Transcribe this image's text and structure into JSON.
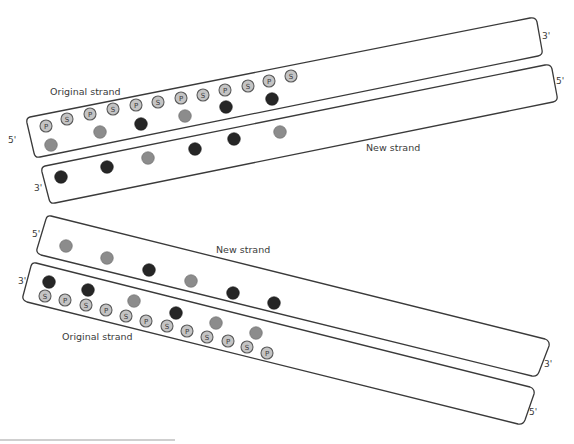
{
  "diagram": {
    "type": "DNA semiconservative replication",
    "colors": {
      "stroke": "#3a3a3a",
      "sp_fill": "#c4c4c4",
      "base_gray": "#8c8c8c",
      "base_dark": "#262626"
    },
    "top_pair": {
      "original": {
        "label": "Original strand",
        "left_end": "5'",
        "right_end": "3'",
        "backbone": [
          {
            "t": "P",
            "x": 46,
            "y": 126
          },
          {
            "t": "S",
            "x": 67,
            "y": 119
          },
          {
            "t": "P",
            "x": 90,
            "y": 114
          },
          {
            "t": "S",
            "x": 113,
            "y": 109
          },
          {
            "t": "P",
            "x": 136,
            "y": 105
          },
          {
            "t": "S",
            "x": 158,
            "y": 102
          },
          {
            "t": "P",
            "x": 181,
            "y": 98
          },
          {
            "t": "S",
            "x": 203,
            "y": 95
          },
          {
            "t": "P",
            "x": 225,
            "y": 90
          },
          {
            "t": "S",
            "x": 248,
            "y": 86
          },
          {
            "t": "P",
            "x": 269,
            "y": 81
          },
          {
            "t": "S",
            "x": 291,
            "y": 76
          }
        ],
        "bases": [
          {
            "c": "gray",
            "x": 51,
            "y": 145
          },
          {
            "c": "gray",
            "x": 100,
            "y": 132
          },
          {
            "c": "dark",
            "x": 141,
            "y": 124
          },
          {
            "c": "gray",
            "x": 185,
            "y": 116
          },
          {
            "c": "dark",
            "x": 226,
            "y": 107
          },
          {
            "c": "dark",
            "x": 272,
            "y": 99
          }
        ]
      },
      "new": {
        "label": "New strand",
        "left_end": "3'",
        "right_end": "5'",
        "bases": [
          {
            "c": "dark",
            "x": 61,
            "y": 177
          },
          {
            "c": "dark",
            "x": 107,
            "y": 167
          },
          {
            "c": "gray",
            "x": 148,
            "y": 158
          },
          {
            "c": "dark",
            "x": 195,
            "y": 149
          },
          {
            "c": "dark",
            "x": 234,
            "y": 139
          },
          {
            "c": "gray",
            "x": 280,
            "y": 132
          }
        ]
      }
    },
    "bottom_pair": {
      "new": {
        "label": "New strand",
        "left_end": "5'",
        "right_end": "3'",
        "bases": [
          {
            "c": "gray",
            "x": 66,
            "y": 246
          },
          {
            "c": "gray",
            "x": 107,
            "y": 258
          },
          {
            "c": "dark",
            "x": 149,
            "y": 270
          },
          {
            "c": "gray",
            "x": 191,
            "y": 281
          },
          {
            "c": "dark",
            "x": 233,
            "y": 293
          },
          {
            "c": "dark",
            "x": 274,
            "y": 303
          }
        ]
      },
      "original": {
        "label": "Original strand",
        "left_end": "3'",
        "right_end": "5'",
        "bases": [
          {
            "c": "dark",
            "x": 49,
            "y": 282
          },
          {
            "c": "dark",
            "x": 88,
            "y": 290
          },
          {
            "c": "gray",
            "x": 134,
            "y": 301
          },
          {
            "c": "dark",
            "x": 176,
            "y": 313
          },
          {
            "c": "gray",
            "x": 216,
            "y": 323
          },
          {
            "c": "gray",
            "x": 256,
            "y": 333
          }
        ],
        "backbone": [
          {
            "t": "S",
            "x": 45,
            "y": 296
          },
          {
            "t": "P",
            "x": 65,
            "y": 300
          },
          {
            "t": "S",
            "x": 86,
            "y": 305
          },
          {
            "t": "P",
            "x": 106,
            "y": 310
          },
          {
            "t": "S",
            "x": 126,
            "y": 316
          },
          {
            "t": "P",
            "x": 146,
            "y": 321
          },
          {
            "t": "S",
            "x": 167,
            "y": 326
          },
          {
            "t": "P",
            "x": 187,
            "y": 331
          },
          {
            "t": "S",
            "x": 207,
            "y": 337
          },
          {
            "t": "P",
            "x": 228,
            "y": 341
          },
          {
            "t": "S",
            "x": 247,
            "y": 347
          },
          {
            "t": "P",
            "x": 267,
            "y": 353
          }
        ]
      }
    }
  }
}
